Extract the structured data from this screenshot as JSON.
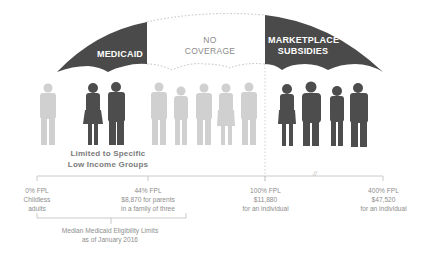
{
  "umbrella": {
    "medicaid_label": "MEDICAID",
    "no_coverage_line1": "NO",
    "no_coverage_line2": "COVERAGE",
    "marketplace_line1": "MARKETPLACE",
    "marketplace_line2": "SUBSIDIES",
    "colors": {
      "covered": "#4a4a4a",
      "uncovered_outline": "#c8c8c8",
      "people_covered": "#4d4d4d",
      "people_uncovered": "#cfcfcf"
    }
  },
  "people": {
    "groups": [
      {
        "name": "childless-adult",
        "count": 1,
        "covered": false
      },
      {
        "name": "parents-low-income",
        "count": 2,
        "covered": true
      },
      {
        "name": "coverage-gap",
        "count": 5,
        "covered": false
      },
      {
        "name": "marketplace",
        "count": 4,
        "covered": true
      }
    ],
    "limited_line1": "Limited to Specific",
    "limited_line2": "Low Income Groups"
  },
  "axis": {
    "break_symbol": "//",
    "ticks": [
      {
        "line1": "0% FPL",
        "line2": "Childless",
        "line3": "adults"
      },
      {
        "line1": "44% FPL",
        "line2": "$8,870 for parents",
        "line3": "in a family of three"
      },
      {
        "line1": "100% FPL",
        "line2": "$11,880",
        "line3": "for an individual"
      },
      {
        "line1": "400% FPL",
        "line2": "$47,520",
        "line3": "for an individual"
      }
    ],
    "median_line1": "Median Medicaid Eligibility Limits",
    "median_line2": "as of January 2016"
  }
}
